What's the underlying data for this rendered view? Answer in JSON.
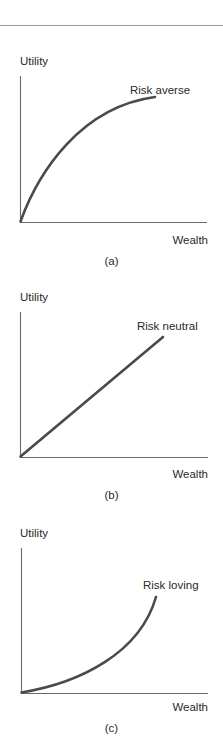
{
  "chart_data": [
    {
      "type": "line",
      "panel": "(a)",
      "title": "",
      "xlabel": "Wealth",
      "ylabel": "Utility",
      "annotation": "Risk averse",
      "shape": "concave",
      "grid": false,
      "legend": null,
      "x": [
        0,
        0.2,
        0.4,
        0.6,
        0.8,
        1.0
      ],
      "values": [
        0,
        0.46,
        0.7,
        0.84,
        0.92,
        0.96
      ],
      "xlim": [
        0,
        1.4
      ],
      "ylim": [
        0,
        1.0
      ]
    },
    {
      "type": "line",
      "panel": "(b)",
      "title": "",
      "xlabel": "Wealth",
      "ylabel": "Utility",
      "annotation": "Risk neutral",
      "shape": "linear",
      "grid": false,
      "legend": null,
      "x": [
        0,
        0.2,
        0.4,
        0.6,
        0.8,
        1.0
      ],
      "values": [
        0,
        0.17,
        0.34,
        0.52,
        0.69,
        0.86
      ],
      "xlim": [
        0,
        1.3
      ],
      "ylim": [
        0,
        1.0
      ]
    },
    {
      "type": "line",
      "panel": "(c)",
      "title": "",
      "xlabel": "Wealth",
      "ylabel": "Utility",
      "annotation": "Risk loving",
      "shape": "convex",
      "grid": false,
      "legend": null,
      "x": [
        0,
        0.2,
        0.4,
        0.6,
        0.8,
        1.0
      ],
      "values": [
        0,
        0.05,
        0.13,
        0.25,
        0.45,
        0.66
      ],
      "xlim": [
        0,
        1.37
      ],
      "ylim": [
        0,
        1.0
      ]
    }
  ],
  "panels": [
    {
      "ylabel": "Utility",
      "xlabel": "Wealth",
      "annotation": "Risk averse",
      "caption": "(a)",
      "top": 53,
      "axis": {
        "x0": 20,
        "y0": 169,
        "ytop": 23,
        "xend": 207
      },
      "curve": "M20.5,168.5 C38,120 80,54 155,44",
      "annot_pos": {
        "left": 130,
        "top": 31
      },
      "xlabel_top": 181,
      "caption_top": 202
    },
    {
      "ylabel": "Utility",
      "xlabel": "Wealth",
      "annotation": "Risk neutral",
      "caption": "(b)",
      "top": 289,
      "axis": {
        "x0": 20,
        "y0": 168,
        "ytop": 23,
        "xend": 208
      },
      "curve": "M20.5,167.5 L163,48",
      "annot_pos": {
        "left": 137,
        "top": 31
      },
      "xlabel_top": 179,
      "caption_top": 200
    },
    {
      "ylabel": "Utility",
      "xlabel": "Wealth",
      "annotation": "Risk loving",
      "caption": "(c)",
      "top": 525,
      "axis": {
        "x0": 21,
        "y0": 168,
        "ytop": 23,
        "xend": 208
      },
      "curve": "M21.5,167.5 C80,158 140,128 156,72",
      "annot_pos": {
        "left": 143,
        "top": 54
      },
      "xlabel_top": 176,
      "caption_top": 197
    }
  ],
  "colors": {
    "axis": "#6a6a6a",
    "curve": "#4a4a4a",
    "text": "#2a2a2a",
    "rule": "#9a9a9a"
  }
}
